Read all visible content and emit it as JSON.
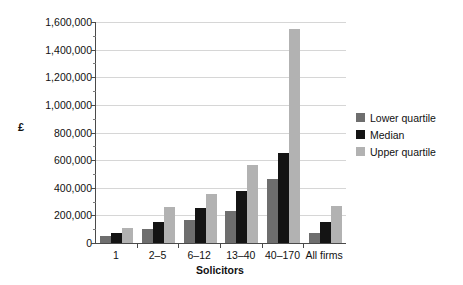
{
  "chart_data": {
    "type": "bar",
    "title": "",
    "xlabel": "Solicitors",
    "ylabel": "£",
    "categories": [
      "1",
      "2–5",
      "6–12",
      "13–40",
      "40–170",
      "All firms"
    ],
    "series": [
      {
        "name": "Lower quartile",
        "color": "#6e6e6e",
        "values": [
          50000,
          100000,
          165000,
          235000,
          460000,
          70000
        ]
      },
      {
        "name": "Median",
        "color": "#141414",
        "values": [
          75000,
          150000,
          250000,
          380000,
          650000,
          150000
        ]
      },
      {
        "name": "Upper quartile",
        "color": "#b2b2b2",
        "values": [
          110000,
          260000,
          355000,
          565000,
          1550000,
          270000
        ]
      }
    ],
    "ylim": [
      0,
      1600000
    ],
    "ytick_values": [
      0,
      200000,
      400000,
      600000,
      800000,
      1000000,
      1200000,
      1400000,
      1600000
    ],
    "ytick_labels": [
      "0",
      "200,000",
      "400,000",
      "600,000",
      "800,000",
      "1,000,000",
      "1,200,000",
      "1,400,000",
      "1,600,000"
    ],
    "yminor_tick_values": [
      100000,
      300000,
      500000,
      700000,
      900000,
      1100000,
      1300000,
      1500000
    ],
    "grid": true,
    "legend_position": "right"
  }
}
